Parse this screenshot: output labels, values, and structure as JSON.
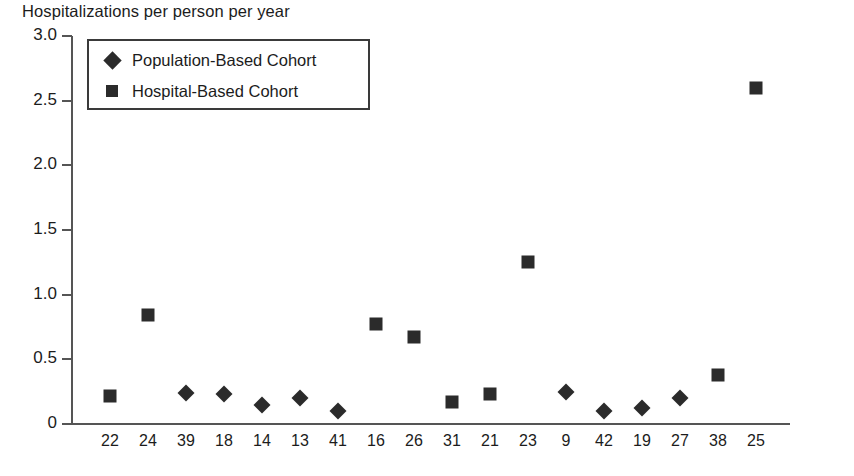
{
  "chart_data": {
    "type": "scatter",
    "title": "Hospitalizations per person per year",
    "xlabel": "",
    "ylabel": "",
    "ylim": [
      0,
      3.0
    ],
    "ytick_labels": [
      "3.0",
      "2.5",
      "2.0",
      "1.5",
      "1.0",
      "0.5",
      "0"
    ],
    "ytick_values": [
      3.0,
      2.5,
      2.0,
      1.5,
      1.0,
      0.5,
      0
    ],
    "grid": false,
    "legend_position": "upper-left-inside",
    "categories": [
      "22",
      "24",
      "39",
      "18",
      "14",
      "13",
      "41",
      "16",
      "26",
      "31",
      "21",
      "23",
      "9",
      "42",
      "19",
      "27",
      "38",
      "25"
    ],
    "series": [
      {
        "name": "Population-Based Cohort",
        "marker": "diamond",
        "color": "#2b2b2b",
        "points": [
          {
            "category": "39",
            "value": 0.24
          },
          {
            "category": "18",
            "value": 0.23
          },
          {
            "category": "14",
            "value": 0.15
          },
          {
            "category": "13",
            "value": 0.2
          },
          {
            "category": "41",
            "value": 0.1
          },
          {
            "category": "9",
            "value": 0.25
          },
          {
            "category": "42",
            "value": 0.1
          },
          {
            "category": "19",
            "value": 0.12
          },
          {
            "category": "27",
            "value": 0.2
          }
        ]
      },
      {
        "name": "Hospital-Based Cohort",
        "marker": "square",
        "color": "#2b2b2b",
        "points": [
          {
            "category": "22",
            "value": 0.22
          },
          {
            "category": "24",
            "value": 0.84
          },
          {
            "category": "16",
            "value": 0.77
          },
          {
            "category": "26",
            "value": 0.67
          },
          {
            "category": "31",
            "value": 0.17
          },
          {
            "category": "21",
            "value": 0.23
          },
          {
            "category": "23",
            "value": 1.25
          },
          {
            "category": "38",
            "value": 0.38
          },
          {
            "category": "25",
            "value": 2.6
          }
        ]
      }
    ]
  }
}
